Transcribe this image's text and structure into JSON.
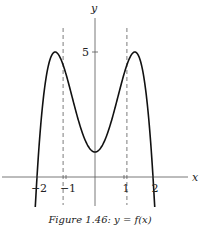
{
  "chart_data": {
    "type": "line",
    "title": "",
    "caption": "Figure 1.46: y = f(x)",
    "xlabel": "x",
    "ylabel": "y",
    "xlim": [
      -2.6,
      2.6
    ],
    "ylim": [
      -1.3,
      6.0
    ],
    "grid": false,
    "x_ticks": [
      {
        "value": -2,
        "label": "−2"
      },
      {
        "value": -1,
        "label": "−1"
      },
      {
        "value": 1,
        "label": "1"
      },
      {
        "value": 2,
        "label": "2"
      }
    ],
    "y_ticks": [
      {
        "value": 5,
        "label": "5"
      }
    ],
    "asymptotes_dashed": [
      -1.1,
      1.1
    ],
    "series": [
      {
        "name": "f(x)",
        "description": "Even function: x-intercepts at ±2, local maxima of 5 near x = ±1.4, local minimum of 1 at x = 0",
        "key_points": [
          {
            "x": -2.05,
            "y": -1.2
          },
          {
            "x": -2,
            "y": 0
          },
          {
            "x": -1.4,
            "y": 5
          },
          {
            "x": 0,
            "y": 1
          },
          {
            "x": 1.4,
            "y": 5
          },
          {
            "x": 2,
            "y": 0
          },
          {
            "x": 2.05,
            "y": -1.2
          }
        ]
      }
    ]
  }
}
